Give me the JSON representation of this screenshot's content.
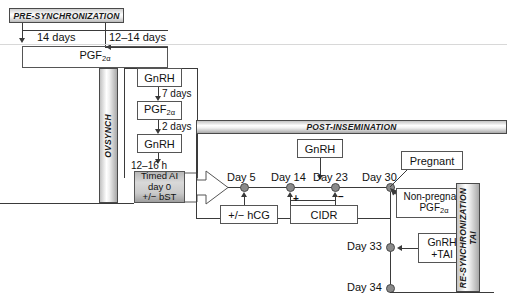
{
  "diagram": {
    "title_bars": {
      "pre_sync": "PRE-SYNCHRONIZATION",
      "ovsynch": "OVSYNCH",
      "post_insemination": "POST-INSEMINATION",
      "resync_line1": "RE-SYNCHRONIZATION",
      "resync_line2": "TAI"
    },
    "presync": {
      "interval_left": "14 days",
      "interval_right": "12–14 days",
      "treatment": "PGF",
      "treatment_sub": "2α"
    },
    "ovsynch_stack": [
      {
        "label": "GnRH",
        "sub": "",
        "interval_below": "7 days"
      },
      {
        "label": "PGF",
        "sub": "2α",
        "interval_below": "2 days"
      },
      {
        "label": "GnRH",
        "sub": "",
        "interval_below": "12–16 h"
      }
    ],
    "timed_ai": {
      "line1": "Timed AI",
      "line2": "day 0",
      "line3": "+/− bST"
    },
    "post_insemination": {
      "gnrh_box": "GnRH",
      "day_markers": [
        {
          "label": "Day 5"
        },
        {
          "label": "Day 14"
        },
        {
          "label": "Day 23"
        },
        {
          "label": "Day 30"
        }
      ],
      "hcg_box": "+/− hCG",
      "cidr_box": "CIDR",
      "cidr_insert_sign": "+",
      "cidr_remove_sign": "−"
    },
    "outcomes": {
      "pregnant": "Pregnant",
      "nonpregnant_line1": "Non-pregnant",
      "nonpregnant_line2": "PGF",
      "nonpregnant_sub": "2α"
    },
    "resync": {
      "day33": "Day 33",
      "day34": "Day 34",
      "gnrh_tai_line1": "GnRH",
      "gnrh_tai_line2": "+TAI"
    },
    "colors": {
      "line": "#3a3a3a",
      "node": "#8a8a8a",
      "box_border": "#555555",
      "shade": "#c9c9c9",
      "text": "#111111"
    }
  }
}
